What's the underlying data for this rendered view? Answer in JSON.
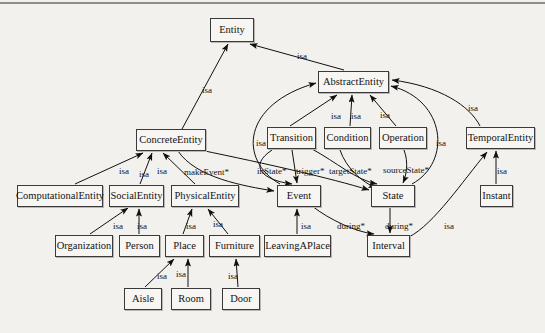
{
  "diagram": {
    "background_color": "#f2f1ee",
    "node_fill": "#f7f6f3",
    "node_stroke": "#3a3a3a",
    "edge_color": "#1a1a1a",
    "nodes": [
      {
        "id": "entity",
        "label": "Entity",
        "x": 210,
        "y": 18,
        "w": 44,
        "h": 24
      },
      {
        "id": "abstract-entity",
        "label": "AbstractEntity",
        "x": 318,
        "y": 71,
        "w": 71,
        "h": 22
      },
      {
        "id": "concrete-entity",
        "label": "ConcreteEntity",
        "x": 136,
        "y": 129,
        "w": 70,
        "h": 22
      },
      {
        "id": "transition",
        "label": "Transition",
        "x": 267,
        "y": 127,
        "w": 49,
        "h": 22
      },
      {
        "id": "condition",
        "label": "Condition",
        "x": 324,
        "y": 127,
        "w": 47,
        "h": 22
      },
      {
        "id": "operation",
        "label": "Operation",
        "x": 379,
        "y": 127,
        "w": 48,
        "h": 22
      },
      {
        "id": "temporal-entity",
        "label": "TemporalEntity",
        "x": 466,
        "y": 127,
        "w": 69,
        "h": 22
      },
      {
        "id": "computational-entity",
        "label": "ComputationalEntity",
        "x": 17,
        "y": 185,
        "w": 86,
        "h": 22
      },
      {
        "id": "social-entity",
        "label": "SocialEntity",
        "x": 109,
        "y": 185,
        "w": 55,
        "h": 22
      },
      {
        "id": "physical-entity",
        "label": "PhysicalEntity",
        "x": 171,
        "y": 185,
        "w": 68,
        "h": 22
      },
      {
        "id": "event",
        "label": "Event",
        "x": 277,
        "y": 185,
        "w": 44,
        "h": 22
      },
      {
        "id": "state",
        "label": "State",
        "x": 371,
        "y": 185,
        "w": 44,
        "h": 22
      },
      {
        "id": "instant",
        "label": "Instant",
        "x": 480,
        "y": 185,
        "w": 33,
        "h": 22
      },
      {
        "id": "organization",
        "label": "Organization",
        "x": 55,
        "y": 235,
        "w": 58,
        "h": 22
      },
      {
        "id": "person",
        "label": "Person",
        "x": 119,
        "y": 235,
        "w": 41,
        "h": 22
      },
      {
        "id": "place",
        "label": "Place",
        "x": 165,
        "y": 235,
        "w": 39,
        "h": 22
      },
      {
        "id": "furniture",
        "label": "Furniture",
        "x": 209,
        "y": 235,
        "w": 51,
        "h": 22
      },
      {
        "id": "leaving-a-place",
        "label": "LeavingAPlace",
        "x": 264,
        "y": 235,
        "w": 67,
        "h": 22
      },
      {
        "id": "interval",
        "label": "Interval",
        "x": 367,
        "y": 235,
        "w": 43,
        "h": 22
      },
      {
        "id": "aisle",
        "label": "Aisle",
        "x": 124,
        "y": 288,
        "w": 38,
        "h": 22
      },
      {
        "id": "room",
        "label": "Room",
        "x": 171,
        "y": 288,
        "w": 40,
        "h": 22
      },
      {
        "id": "door",
        "label": "Door",
        "x": 222,
        "y": 288,
        "w": 38,
        "h": 22
      }
    ],
    "edges": [
      {
        "from": "concrete-entity",
        "to": "entity",
        "label": "isa",
        "label_x": 202,
        "label_y": 86
      },
      {
        "from": "abstract-entity",
        "to": "entity",
        "label": "isa",
        "label_x": 297,
        "label_y": 52
      },
      {
        "from": "transition",
        "to": "abstract-entity",
        "label": "isa",
        "label_x": 331,
        "label_y": 112
      },
      {
        "from": "condition",
        "to": "abstract-entity",
        "label": "isa",
        "label_x": 351,
        "label_y": 112
      },
      {
        "from": "operation",
        "to": "abstract-entity",
        "label": "isa",
        "label_x": 380,
        "label_y": 111
      },
      {
        "from": "temporal-entity",
        "to": "abstract-entity",
        "label": "isa",
        "label_x": 468,
        "label_y": 104
      },
      {
        "from": "event",
        "to": "abstract-entity",
        "label": "isa",
        "label_x": 256,
        "label_y": 139
      },
      {
        "from": "state",
        "to": "abstract-entity",
        "label": "isa",
        "label_x": 436,
        "label_y": 139
      },
      {
        "from": "computational-entity",
        "to": "concrete-entity",
        "label": "isa",
        "label_x": 119,
        "label_y": 167
      },
      {
        "from": "social-entity",
        "to": "concrete-entity",
        "label": "isa",
        "label_x": 139,
        "label_y": 170
      },
      {
        "from": "physical-entity",
        "to": "concrete-entity",
        "label": "isa",
        "label_x": 157,
        "label_y": 167
      },
      {
        "from": "concrete-entity",
        "to": "event",
        "label": "makeEvent*",
        "label_x": 184,
        "label_y": 168
      },
      {
        "from": "transition",
        "to": "event",
        "label": "inState*",
        "label_x": 257,
        "label_y": 167
      },
      {
        "from": "transition",
        "to": "event",
        "label": "trigger*",
        "label_x": 296,
        "label_y": 167
      },
      {
        "from": "condition",
        "to": "state",
        "label": "targetState*",
        "label_x": 329,
        "label_y": 167
      },
      {
        "from": "operation",
        "to": "state",
        "label": "sourceState*",
        "label_x": 383,
        "label_y": 166
      },
      {
        "from": "organization",
        "to": "social-entity",
        "label": "isa",
        "label_x": 113,
        "label_y": 222
      },
      {
        "from": "person",
        "to": "social-entity",
        "label": "isa",
        "label_x": 137,
        "label_y": 222
      },
      {
        "from": "place",
        "to": "physical-entity",
        "label": "isa",
        "label_x": 186,
        "label_y": 222
      },
      {
        "from": "furniture",
        "to": "physical-entity",
        "label": "isa",
        "label_x": 213,
        "label_y": 220
      },
      {
        "from": "leaving-a-place",
        "to": "event",
        "label": "isa",
        "label_x": 301,
        "label_y": 222
      },
      {
        "from": "event",
        "to": "interval",
        "label": "during*",
        "label_x": 337,
        "label_y": 222
      },
      {
        "from": "state",
        "to": "interval",
        "label": "during*",
        "label_x": 385,
        "label_y": 222
      },
      {
        "from": "interval",
        "to": "temporal-entity",
        "label": "isa",
        "label_x": 444,
        "label_y": 222
      },
      {
        "from": "instant",
        "to": "temporal-entity",
        "label": "isa",
        "label_x": 497,
        "label_y": 167
      },
      {
        "from": "aisle",
        "to": "place",
        "label": "isa",
        "label_x": 157,
        "label_y": 272
      },
      {
        "from": "room",
        "to": "place",
        "label": "isa",
        "label_x": 176,
        "label_y": 270
      },
      {
        "from": "door",
        "to": "furniture",
        "label": "isa",
        "label_x": 228,
        "label_y": 272
      }
    ]
  }
}
